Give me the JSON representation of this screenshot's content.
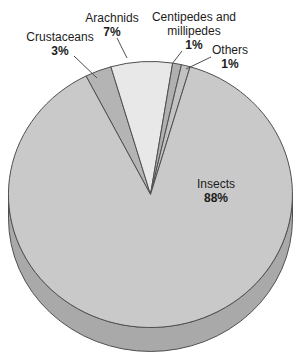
{
  "chart_data": {
    "type": "pie",
    "style": "3d",
    "title": "",
    "total": 100,
    "direction": "clockwise",
    "start_angle_deg": -27,
    "background": "#ffffff",
    "outline_color": "#4f4f4f",
    "depth_color": "#a9a9a9",
    "slices": [
      {
        "label": "Crustaceans",
        "value": 3,
        "pct_label": "3%",
        "color": "#b4b4b4",
        "label_position": "outside"
      },
      {
        "label": "Arachnids",
        "value": 7,
        "pct_label": "7%",
        "color": "#e8e8e8",
        "label_position": "outside"
      },
      {
        "label": "Centipedes and millipedes",
        "value": 1,
        "pct_label": "1%",
        "color": "#b0b0b0",
        "label_position": "outside"
      },
      {
        "label": "Others",
        "value": 1,
        "pct_label": "1%",
        "color": "#c2c2c2",
        "label_position": "outside"
      },
      {
        "label": "Insects",
        "value": 88,
        "pct_label": "88%",
        "color": "#c9c9c9",
        "label_position": "inside"
      }
    ]
  }
}
